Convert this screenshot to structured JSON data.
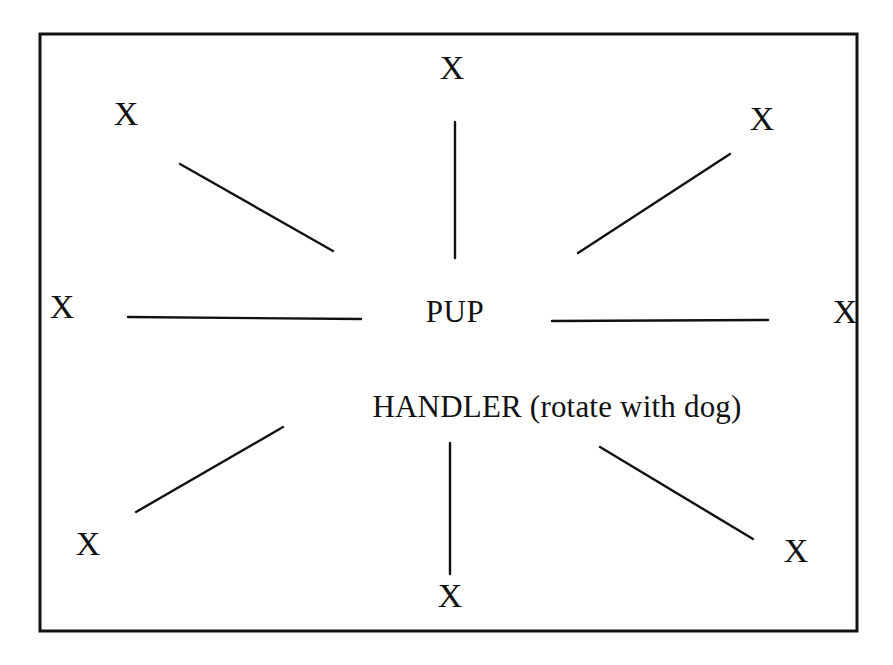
{
  "diagram": {
    "frame": {
      "stroke_color": "#111111",
      "fill_color": "#ffffff",
      "x": 40,
      "y": 34,
      "width": 817,
      "height": 597,
      "stroke_width": 3
    },
    "center_labels": [
      {
        "id": "pup",
        "text": "PUP",
        "x": 455,
        "y": 312
      },
      {
        "id": "handler",
        "text": "HANDLER (rotate with dog)",
        "x": 557,
        "y": 407
      }
    ],
    "markers": [
      {
        "id": "marker-top",
        "label": "X",
        "x": 452,
        "y": 68,
        "position": "top"
      },
      {
        "id": "marker-top-left",
        "label": "X",
        "x": 126,
        "y": 114,
        "position": "top-left"
      },
      {
        "id": "marker-top-right",
        "label": "X",
        "x": 762,
        "y": 119,
        "position": "top-right"
      },
      {
        "id": "marker-left",
        "label": "X",
        "x": 62,
        "y": 307,
        "position": "left"
      },
      {
        "id": "marker-right",
        "label": "X",
        "x": 845,
        "y": 312,
        "position": "right"
      },
      {
        "id": "marker-bottom-left",
        "label": "X",
        "x": 88,
        "y": 544,
        "position": "bottom-left"
      },
      {
        "id": "marker-bottom-right",
        "label": "X",
        "x": 796,
        "y": 551,
        "position": "bottom-right"
      },
      {
        "id": "marker-bottom",
        "label": "X",
        "x": 450,
        "y": 596,
        "position": "bottom"
      }
    ],
    "spokes": [
      {
        "id": "spoke-top",
        "x1": 455,
        "y1": 122,
        "x2": 455,
        "y2": 258,
        "stroke_width": 2.4
      },
      {
        "id": "spoke-top-left",
        "x1": 180,
        "y1": 164,
        "x2": 333,
        "y2": 251,
        "stroke_width": 2.4
      },
      {
        "id": "spoke-top-right",
        "x1": 578,
        "y1": 253,
        "x2": 730,
        "y2": 154,
        "stroke_width": 2.4
      },
      {
        "id": "spoke-left",
        "x1": 128,
        "y1": 317,
        "x2": 361,
        "y2": 319,
        "stroke_width": 2.4
      },
      {
        "id": "spoke-right",
        "x1": 552,
        "y1": 321,
        "x2": 768,
        "y2": 320,
        "stroke_width": 2.4
      },
      {
        "id": "spoke-bottom-left",
        "x1": 136,
        "y1": 512,
        "x2": 283,
        "y2": 427,
        "stroke_width": 2.4
      },
      {
        "id": "spoke-bottom-right",
        "x1": 600,
        "y1": 447,
        "x2": 753,
        "y2": 539,
        "stroke_width": 2.4
      },
      {
        "id": "spoke-bottom",
        "x1": 450,
        "y1": 443,
        "x2": 450,
        "y2": 574,
        "stroke_width": 2.4
      }
    ]
  }
}
